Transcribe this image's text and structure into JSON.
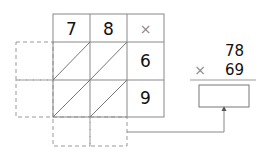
{
  "lattice": {
    "top_digits": [
      "7",
      "8"
    ],
    "operator": "×",
    "right_digits": [
      "6",
      "9"
    ]
  },
  "problem": {
    "multiplicand": "78",
    "operator": "×",
    "multiplier": "69",
    "answer": ""
  },
  "colors": {
    "grid": "#888888",
    "text": "#111111"
  }
}
